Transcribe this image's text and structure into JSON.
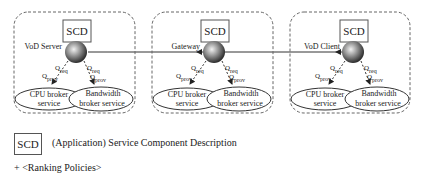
{
  "diagram": {
    "nodes": [
      {
        "id": "vod-server",
        "label": "VoD Server",
        "scd": "SCD",
        "cpu_service": [
          "CPU broker",
          "service"
        ],
        "bw_service": [
          "Bandwidth",
          "broker service"
        ],
        "q_req": "Q",
        "q_req_sub": "req",
        "q_prov": "Q",
        "q_prov_sub": "prov"
      },
      {
        "id": "gateway",
        "label": "Gateway",
        "scd": "SCD",
        "cpu_service": [
          "CPU broker",
          "service"
        ],
        "bw_service": [
          "Bandwidth",
          "broker service"
        ],
        "q_req": "Q",
        "q_req_sub": "req",
        "q_prov": "Q",
        "q_prov_sub": "prov"
      },
      {
        "id": "vod-client",
        "label": "VoD Client",
        "scd": "SCD",
        "cpu_service": [
          "CPU broker",
          "service"
        ],
        "bw_service": [
          "Bandwidth",
          "broker service"
        ],
        "q_req": "Q",
        "q_req_sub": "req",
        "q_prov": "Q",
        "q_prov_sub": "prov"
      }
    ]
  },
  "legend": {
    "scd_label": "SCD",
    "scd_description": "(Application) Service Component Description",
    "ranking": "+ <Ranking Policies>"
  },
  "colors": {
    "line": "#333333",
    "dash": "#666666",
    "sphere_light": "#eeeeee",
    "sphere_dark": "#3a3a3a"
  }
}
